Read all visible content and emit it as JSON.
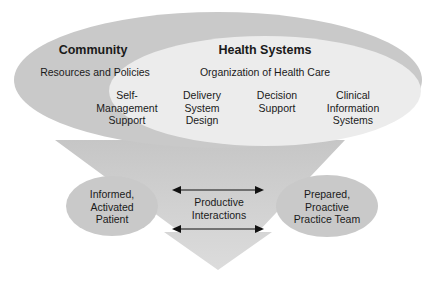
{
  "diagram": {
    "outer_ellipse": {
      "title": "Community",
      "subtitle": "Resources and Policies",
      "color": "#c9c9c9"
    },
    "inner_ellipse": {
      "title": "Health Systems",
      "subtitle": "Organization of Health Care",
      "color": "#ececec"
    },
    "components": [
      {
        "label": "Self-\nManagement\nSupport"
      },
      {
        "label": "Delivery\nSystem\nDesign"
      },
      {
        "label": "Decision\nSupport"
      },
      {
        "label": "Clinical\nInformation\nSystems"
      }
    ],
    "left_node": {
      "label": "Informed,\nActivated\nPatient"
    },
    "right_node": {
      "label": "Prepared,\nProactive\nPractice Team"
    },
    "interaction": {
      "label": "Productive\nInteractions"
    },
    "funnel_color": "#d2d2d2",
    "arrow_color": "#111111"
  }
}
